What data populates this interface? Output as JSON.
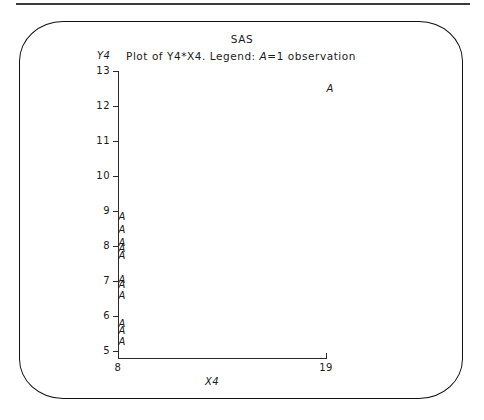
{
  "header": {
    "system_title": "SAS"
  },
  "plot": {
    "title": "Plot of Y4*X4. Legend: A=1 observation",
    "title_parts": {
      "prefix": "Plot of Y4",
      "star": "*",
      "middle": "X4. Legend: ",
      "symbol": "A",
      "suffix": "=1 observation"
    },
    "y_var_label": "Y4",
    "x_var_label": "X4"
  },
  "chart_data": {
    "type": "scatter",
    "title": "Plot of Y4*X4. Legend: A=1 observation",
    "subtitle": "SAS",
    "xlabel": "X4",
    "ylabel": "Y4",
    "marker_symbol": "A",
    "legend": "A=1 observation",
    "grid": false,
    "legend_position": "title",
    "xlim": [
      8,
      19
    ],
    "ylim": [
      5,
      13
    ],
    "x_ticks": [
      8,
      19
    ],
    "x_tick_labels": [
      "8",
      "19"
    ],
    "y_ticks": [
      13,
      12,
      11,
      10,
      9,
      8,
      7,
      6,
      5
    ],
    "y_tick_labels": [
      "13",
      "12",
      "11",
      "10",
      "9",
      "8",
      "7",
      "6",
      "5"
    ],
    "series": [
      {
        "name": "Y4 vs X4",
        "points": [
          {
            "x": 19,
            "y": 12.5
          },
          {
            "x": 8,
            "y": 8.84
          },
          {
            "x": 8,
            "y": 8.47
          },
          {
            "x": 8,
            "y": 8.1
          },
          {
            "x": 8,
            "y": 7.91
          },
          {
            "x": 8,
            "y": 7.71
          },
          {
            "x": 8,
            "y": 7.04
          },
          {
            "x": 8,
            "y": 6.89
          },
          {
            "x": 8,
            "y": 6.58
          },
          {
            "x": 8,
            "y": 5.76
          },
          {
            "x": 8,
            "y": 5.56
          },
          {
            "x": 8,
            "y": 5.25
          }
        ]
      }
    ]
  }
}
